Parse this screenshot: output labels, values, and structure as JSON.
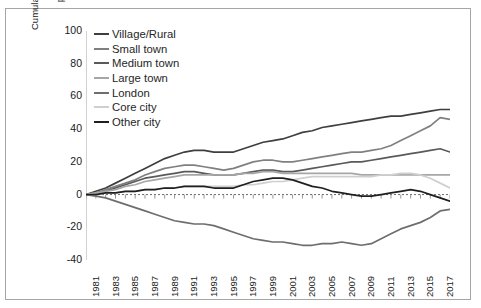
{
  "chart_data": {
    "type": "line",
    "title": "",
    "xlabel": "",
    "ylabel": "Cumulative differential employment growth, percentage points, 1981-2018",
    "ylabel_line1": "Cumulative differential employment growth,",
    "ylabel_line2": "percentage points, 1981-2018",
    "ylim": [
      -40,
      100
    ],
    "yticks": [
      100,
      80,
      60,
      40,
      20,
      0,
      -20,
      -40
    ],
    "xlim": [
      1981,
      2018
    ],
    "xticks": [
      1981,
      1983,
      1985,
      1987,
      1989,
      1991,
      1993,
      1995,
      1997,
      1999,
      2001,
      2003,
      2005,
      2007,
      2009,
      2011,
      2013,
      2015,
      2017
    ],
    "x": [
      1981,
      1982,
      1983,
      1984,
      1985,
      1986,
      1987,
      1988,
      1989,
      1990,
      1991,
      1992,
      1993,
      1994,
      1995,
      1996,
      1997,
      1998,
      1999,
      2000,
      2001,
      2002,
      2003,
      2004,
      2005,
      2006,
      2007,
      2008,
      2009,
      2010,
      2011,
      2012,
      2013,
      2014,
      2015,
      2016,
      2017,
      2018
    ],
    "grid": false,
    "legend_position": "top-left",
    "series": [
      {
        "name": "Village/Rural",
        "color": "#3f3f3f",
        "values": [
          0,
          2,
          4,
          7,
          10,
          13,
          16,
          19,
          22,
          24,
          26,
          27,
          27,
          26,
          26,
          26,
          28,
          30,
          32,
          33,
          34,
          36,
          38,
          39,
          41,
          42,
          43,
          44,
          45,
          46,
          47,
          48,
          48,
          49,
          50,
          51,
          52,
          52
        ]
      },
      {
        "name": "Small town",
        "color": "#808080",
        "values": [
          0,
          1,
          3,
          5,
          7,
          9,
          12,
          14,
          16,
          17,
          18,
          18,
          17,
          16,
          15,
          16,
          18,
          20,
          21,
          21,
          20,
          20,
          21,
          22,
          23,
          24,
          25,
          26,
          26,
          27,
          28,
          30,
          33,
          36,
          39,
          42,
          47,
          46
        ]
      },
      {
        "name": "Medium town",
        "color": "#5a5a5a",
        "values": [
          0,
          1,
          2,
          4,
          6,
          8,
          10,
          11,
          12,
          13,
          14,
          14,
          13,
          12,
          12,
          12,
          13,
          14,
          15,
          15,
          14,
          14,
          15,
          16,
          17,
          18,
          19,
          20,
          20,
          21,
          22,
          23,
          24,
          25,
          26,
          27,
          28,
          26
        ]
      },
      {
        "name": "Large town",
        "color": "#a6a6a6",
        "values": [
          0,
          1,
          2,
          3,
          5,
          6,
          8,
          9,
          10,
          11,
          12,
          12,
          12,
          12,
          12,
          12,
          13,
          13,
          14,
          14,
          13,
          13,
          13,
          13,
          13,
          13,
          13,
          13,
          12,
          12,
          12,
          12,
          12,
          12,
          12,
          12,
          12,
          12
        ]
      },
      {
        "name": "London",
        "color": "#6e6e6e",
        "values": [
          0,
          -1,
          -2,
          -4,
          -6,
          -8,
          -10,
          -12,
          -14,
          -16,
          -17,
          -18,
          -18,
          -19,
          -21,
          -23,
          -25,
          -27,
          -28,
          -29,
          -29,
          -30,
          -31,
          -31,
          -30,
          -30,
          -29,
          -30,
          -31,
          -30,
          -27,
          -24,
          -21,
          -19,
          -17,
          -14,
          -10,
          -9
        ]
      },
      {
        "name": "Core city",
        "color": "#cfcfcf",
        "values": [
          0,
          0,
          1,
          1,
          2,
          2,
          3,
          3,
          4,
          4,
          5,
          5,
          5,
          5,
          5,
          5,
          6,
          6,
          7,
          8,
          8,
          9,
          10,
          11,
          11,
          11,
          11,
          11,
          11,
          11,
          12,
          12,
          13,
          13,
          12,
          10,
          7,
          4
        ]
      },
      {
        "name": "Other city",
        "color": "#1f1f1f",
        "values": [
          0,
          0,
          1,
          1,
          2,
          2,
          3,
          3,
          4,
          4,
          5,
          5,
          5,
          4,
          4,
          4,
          6,
          8,
          9,
          10,
          10,
          9,
          7,
          5,
          4,
          2,
          1,
          0,
          -1,
          -1,
          0,
          1,
          2,
          3,
          2,
          0,
          -2,
          -4
        ]
      }
    ]
  }
}
